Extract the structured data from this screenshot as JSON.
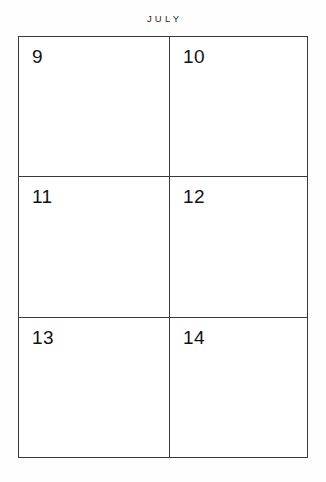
{
  "header": {
    "month_label": "JULY"
  },
  "calendar": {
    "columns": 2,
    "rows": 3,
    "border_color": "#3a3a3a",
    "page_background": "#ffffff",
    "text_color": "#111111",
    "cells": [
      {
        "day": "9"
      },
      {
        "day": "10"
      },
      {
        "day": "11"
      },
      {
        "day": "12"
      },
      {
        "day": "13"
      },
      {
        "day": "14"
      }
    ]
  }
}
